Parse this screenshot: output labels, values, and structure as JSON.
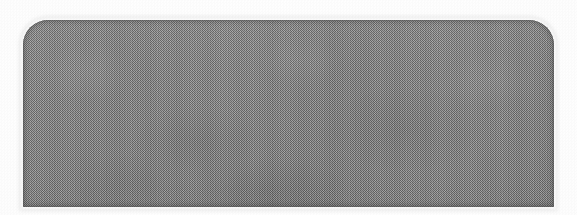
{
  "image": {
    "kind": "scanned-document-figure",
    "description": "Solid medium-gray rounded panel on white paper, reproduced with a halftone dither",
    "background_color": "#ffffff",
    "width_px": 577,
    "height_px": 215
  },
  "panel": {
    "label": "",
    "fill_color": "#8b8b8b",
    "edge_color": "#5a5a5a",
    "texture": "halftone-dither",
    "left_px": 23,
    "top_px": 20,
    "width_px": 531,
    "height_px": 187,
    "corner_radius_top_px": 25,
    "corner_radius_bottom_px": 1
  }
}
